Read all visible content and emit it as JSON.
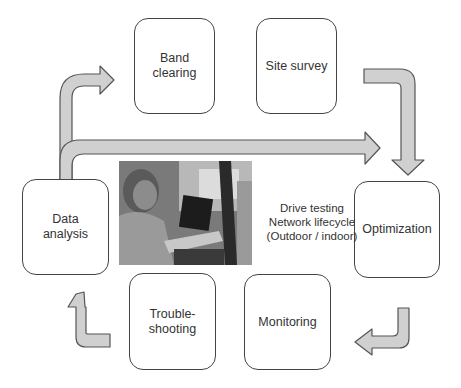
{
  "diagram": {
    "title": "Drive testing network lifecycle",
    "stages": [
      {
        "id": "band-clearing",
        "label": "Band\nclearing"
      },
      {
        "id": "site-survey",
        "label": "Site survey"
      },
      {
        "id": "optimization",
        "label": "Optimization"
      },
      {
        "id": "monitoring",
        "label": "Monitoring"
      },
      {
        "id": "troubleshooting",
        "label": "Trouble-\nshooting"
      },
      {
        "id": "data-analysis",
        "label": "Data\nanalysis"
      }
    ],
    "center_caption": "Drive testing\nNetwork lifecycle\n(Outdoor / indoor)",
    "photo": {
      "description": "Engineer in car using laptop for drive testing"
    },
    "colors": {
      "arrow_fill": "#d0d0d0",
      "arrow_stroke": "#555555",
      "box_stroke": "#444444"
    }
  }
}
